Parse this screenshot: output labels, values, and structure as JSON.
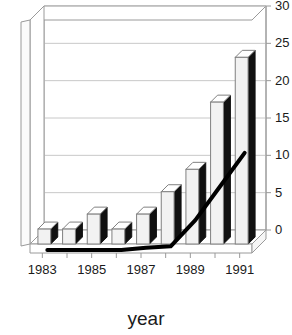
{
  "chart_data": {
    "type": "bar",
    "title": "",
    "subtitle": "",
    "xlabel": "year",
    "ylabel": "",
    "categories": [
      "1983",
      "1984",
      "1985",
      "1986",
      "1987",
      "1988",
      "1989",
      "1990",
      "1991"
    ],
    "xtick_labels": [
      "1983",
      "1985",
      "1987",
      "1989",
      "1991"
    ],
    "xtick_categories": [
      "1983",
      "1985",
      "1987",
      "1989",
      "1991"
    ],
    "ytick_labels": [
      "0",
      "5",
      "10",
      "15",
      "20",
      "25",
      "30"
    ],
    "ytick_values": [
      0,
      5,
      10,
      15,
      20,
      25,
      30
    ],
    "ylim": [
      0,
      30
    ],
    "grid": true,
    "grid_axis": "y",
    "legend": "none",
    "style": "3d-perspective",
    "series": [
      {
        "name": "bars",
        "render": "bar-3d-white",
        "values": [
          2,
          2,
          4,
          2,
          4,
          7,
          10,
          19,
          25
        ]
      },
      {
        "name": "line",
        "render": "line-thick-black",
        "values": [
          0,
          0,
          0,
          0,
          0.3,
          0.5,
          4,
          8.5,
          13
        ]
      }
    ],
    "colors": {
      "bar_face": "#f2f2f2",
      "bar_outline": "#808080",
      "bar_side": "#111111",
      "line": "#000000",
      "grid": "#c8c8c8",
      "axis": "#9a9a9a",
      "text": "#1a1a1a",
      "background": "#ffffff"
    }
  },
  "axes": {
    "x_title": "year"
  }
}
